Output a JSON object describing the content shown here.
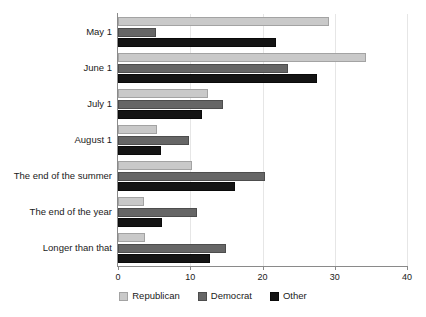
{
  "chart_data": {
    "type": "bar",
    "orientation": "horizontal",
    "title": "",
    "subtitle": "",
    "xlabel": "",
    "ylabel": "",
    "xlim": [
      0,
      40
    ],
    "xticks": [
      0,
      10,
      20,
      30,
      40
    ],
    "xtick_labels": [
      "0",
      "10",
      "20",
      "30",
      "40"
    ],
    "grid": true,
    "grid_axis": "x",
    "legend_position": "bottom-center",
    "categories": [
      "May 1",
      "June 1",
      "July 1",
      "August 1",
      "The end of the summer",
      "The end of the year",
      "Longer than that"
    ],
    "series": [
      {
        "name": "Republican",
        "color": "#c9c9c9",
        "values": [
          29.2,
          34.3,
          12.5,
          5.4,
          10.2,
          3.6,
          3.7
        ]
      },
      {
        "name": "Democrat",
        "color": "#666666",
        "values": [
          5.3,
          23.5,
          14.5,
          9.8,
          20.3,
          10.9,
          15.0
        ]
      },
      {
        "name": "Other",
        "color": "#141414",
        "values": [
          21.9,
          27.6,
          11.6,
          5.9,
          16.2,
          6.1,
          12.7
        ]
      }
    ]
  },
  "legend": {
    "items": [
      {
        "label": "Republican",
        "swatch": "rep"
      },
      {
        "label": "Democrat",
        "swatch": "dem"
      },
      {
        "label": "Other",
        "swatch": "oth"
      }
    ]
  },
  "axis": {
    "x_min_label": "0",
    "x_max_label": "40"
  }
}
